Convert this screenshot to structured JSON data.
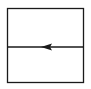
{
  "diagram": {
    "type": "box-with-horizontal-arrow",
    "stroke_color": "#1a1a1a",
    "background": "#ffffff",
    "box": {
      "x": 7,
      "y": 8,
      "width": 77,
      "height": 75
    },
    "divider": {
      "y": 47,
      "x1": 7,
      "x2": 84
    },
    "arrow": {
      "direction": "left",
      "tip_x": 41,
      "tail_x": 52,
      "y": 47
    }
  }
}
